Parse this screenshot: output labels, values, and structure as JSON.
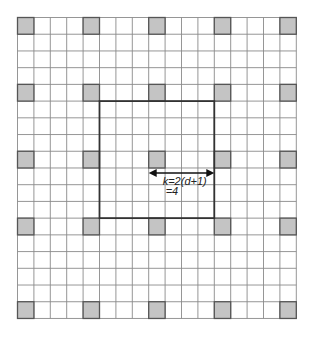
{
  "diagram": {
    "grid": {
      "columns": 17,
      "rows": 18,
      "origin_x": 17.5,
      "origin_y": 17.5,
      "cell_w": 16.4,
      "cell_h": 16.72,
      "line_color": "#8a8a8a"
    },
    "shaded_cells": {
      "columns": [
        0,
        4,
        8,
        12,
        16
      ],
      "rows": [
        0,
        4,
        8,
        12,
        17
      ],
      "fill": "#c4c4c4",
      "stroke": "#555555"
    },
    "bold_square": {
      "col_start": 5,
      "row_start": 5,
      "col_end": 12,
      "row_end": 12,
      "stroke": "#333333"
    },
    "arrow": {
      "from_col": 8,
      "to_col": 12,
      "y": 173,
      "color": "#111111"
    },
    "annotation": {
      "line1": "k=2(d+1)",
      "line2": "=4"
    }
  }
}
